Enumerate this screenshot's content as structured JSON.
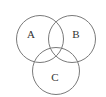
{
  "diagram": {
    "type": "venn",
    "stroke_color": "#7a7a7a",
    "background": "#ffffff",
    "sets": [
      {
        "id": "A",
        "label": "A",
        "cx": 40,
        "cy": 39,
        "r": 23.5,
        "label_x": 31,
        "label_y": 34
      },
      {
        "id": "B",
        "label": "B",
        "cx": 72,
        "cy": 39,
        "r": 23.5,
        "label_x": 76,
        "label_y": 34
      },
      {
        "id": "C",
        "label": "C",
        "cx": 56,
        "cy": 71,
        "r": 23.5,
        "label_x": 55,
        "label_y": 77
      }
    ]
  }
}
